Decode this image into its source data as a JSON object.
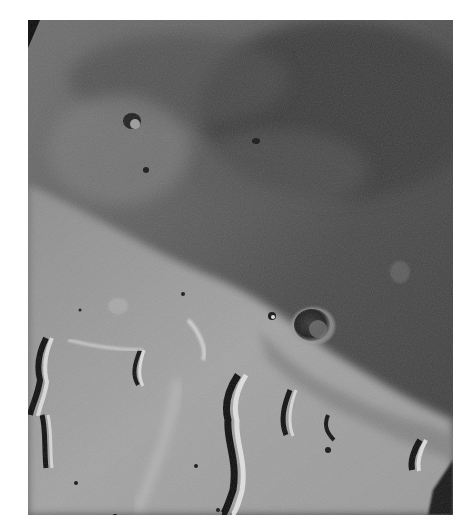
{
  "image": {
    "subject": "grayscale orbital photograph of cratered, channeled planetary terrain",
    "palette": {
      "background": "#ffffff",
      "dark_terrain": "#3e3e3e",
      "mid_terrain": "#6e6e6e",
      "bright_plain": "#a9a9a9",
      "shadow": "#0d0d0d",
      "highlight": "#dcdcdc"
    }
  }
}
